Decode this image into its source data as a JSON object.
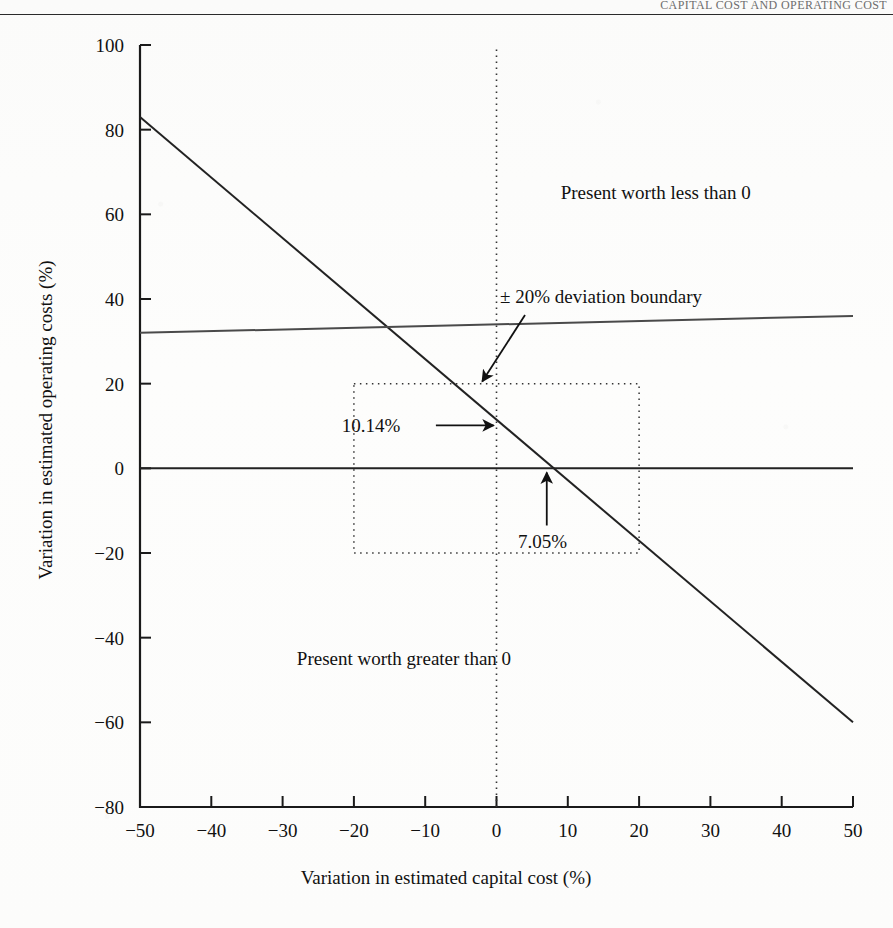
{
  "header": {
    "running_head": "CAPITAL COST AND OPERATING COST"
  },
  "chart_data": {
    "type": "line",
    "title": "",
    "xlabel": "Variation in estimated capital cost (%)",
    "ylabel": "Variation in estimated operating costs (%)",
    "xlim": [
      -50,
      50
    ],
    "ylim": [
      -80,
      100
    ],
    "xticks": [
      -50,
      -40,
      -30,
      -20,
      -10,
      0,
      10,
      20,
      30,
      40,
      50
    ],
    "xtick_labels": [
      "−50",
      "−40",
      "−30",
      "−20",
      "−10",
      "0",
      "10",
      "20",
      "30",
      "40",
      "50"
    ],
    "yticks": [
      -80,
      -60,
      -40,
      -20,
      0,
      20,
      40,
      60,
      80,
      100
    ],
    "ytick_labels": [
      "−80",
      "−60",
      "−40",
      "−20",
      "0",
      "20",
      "40",
      "60",
      "80",
      "100"
    ],
    "grid": false,
    "legend_position": "none",
    "series": [
      {
        "name": "break-even line",
        "style": "solid",
        "x": [
          -50,
          50
        ],
        "y": [
          83,
          -60
        ]
      },
      {
        "name": "deviation boundary line",
        "style": "solid",
        "x": [
          -50,
          50
        ],
        "y": [
          32,
          36
        ]
      },
      {
        "name": "zero operating cost variation axis",
        "style": "solid",
        "x": [
          -50,
          50
        ],
        "y": [
          0,
          0
        ]
      },
      {
        "name": "zero capital cost variation axis",
        "style": "dotted",
        "x": [
          0,
          0
        ],
        "y": [
          -80,
          100
        ]
      }
    ],
    "regions": [
      {
        "name": "plus-minus-20-percent-box",
        "style": "dotted",
        "x0": -20,
        "x1": 20,
        "y0": -20,
        "y1": 20
      }
    ],
    "annotations": [
      {
        "id": "deviation-boundary",
        "text": "± 20% deviation boundary",
        "text_x": 0.5,
        "text_y": 40.5,
        "arrow_from_x": 4.0,
        "arrow_from_y": 36.2,
        "arrow_to_x": -2.0,
        "arrow_to_y": 20.5
      },
      {
        "id": "present-worth-less-than-zero",
        "text": "Present worth less than 0",
        "text_x": 9.0,
        "text_y": 65.0
      },
      {
        "id": "present-worth-greater-than-zero",
        "text": "Present worth greater than 0",
        "text_x": -28.0,
        "text_y": -45.0
      },
      {
        "id": "operating-cost-intercept",
        "text": "10.14%",
        "value": 10.14,
        "text_x": -13.5,
        "text_y": 10.0,
        "arrow_from_x": -8.5,
        "arrow_from_y": 10.14,
        "arrow_to_x": -0.4,
        "arrow_to_y": 10.14
      },
      {
        "id": "capital-cost-intercept",
        "text": "7.05%",
        "value": 7.05,
        "text_x": 3.0,
        "text_y": -17.5,
        "arrow_from_x": 7.05,
        "arrow_from_y": -13.5,
        "arrow_to_x": 7.05,
        "arrow_to_y": -1.0
      }
    ],
    "colors": {
      "ink": "#1a1a1a",
      "line": "#222222",
      "boundary_line": "#4a4a4a",
      "dotted": "#333333",
      "paper": "#fdfdfc"
    }
  }
}
